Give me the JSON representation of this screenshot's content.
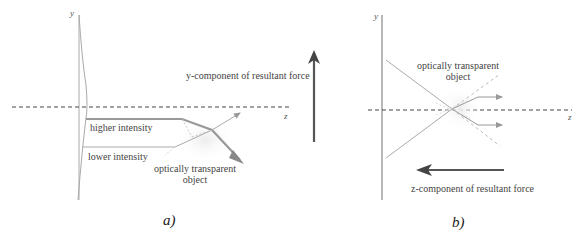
{
  "panel_a": {
    "caption": "a)",
    "axis_y": "y",
    "axis_z": "z",
    "label_higher": "higher intensity",
    "label_lower": "lower intensity",
    "label_object_line1": "optically transparent",
    "label_object_line2": "object",
    "label_force": "y-component of resultant force"
  },
  "panel_b": {
    "caption": "b)",
    "axis_y": "y",
    "axis_z": "z",
    "label_object_line1": "optically transparent",
    "label_object_line2": "object",
    "label_force": "z-component of resultant force"
  },
  "colors": {
    "beam": "#a0a0a0",
    "force_arrow": "#555555",
    "axis": "#999999",
    "dashed": "#444444"
  }
}
